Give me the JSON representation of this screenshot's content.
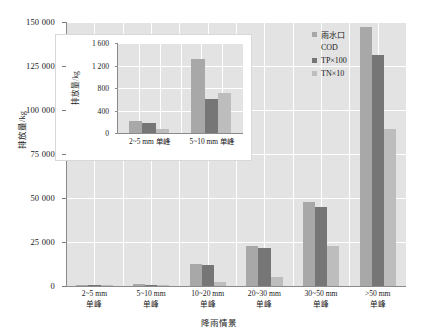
{
  "chart_data": {
    "type": "bar",
    "title": "",
    "xlabel": "降雨情景",
    "ylabel": "排放量/kg",
    "ylim": [
      0,
      150000
    ],
    "yticks": [
      "0",
      "25 000",
      "50 000",
      "75 000",
      "100 000",
      "125 000",
      "150 000"
    ],
    "ytick_values": [
      0,
      25000,
      50000,
      75000,
      100000,
      125000,
      150000
    ],
    "grid": true,
    "legend_position": "top-right",
    "categories": [
      "2~5 mm\n单峰",
      "5~10 mm\n单峰",
      "10~20 mm\n单峰",
      "20~30 mm\n单峰",
      "30~50 mm\n单峰",
      ">50 mm\n单峰"
    ],
    "category_lines": [
      {
        "top": "2~5 mm",
        "bottom": "单峰"
      },
      {
        "top": "5~10 mm",
        "bottom": "单峰"
      },
      {
        "top": "10~20 mm",
        "bottom": "单峰"
      },
      {
        "top": "20~30 mm",
        "bottom": "单峰"
      },
      {
        "top": "30~50 mm",
        "bottom": "单峰"
      },
      {
        "top": ">50 mm",
        "bottom": "单峰"
      }
    ],
    "series": [
      {
        "name": "雨水口 COD",
        "color": "#a8a8a8",
        "values": [
          210,
          1320,
          12500,
          23000,
          48000,
          147000
        ]
      },
      {
        "name": "TP×100",
        "color": "#767676",
        "values": [
          170,
          610,
          12000,
          21500,
          45000,
          131000
        ]
      },
      {
        "name": "TN×10",
        "color": "#bdbdbd",
        "values": [
          70,
          720,
          2500,
          5000,
          23000,
          89000
        ]
      }
    ],
    "legend": [
      {
        "label": "雨水口",
        "label2": "COD",
        "color": "#a8a8a8"
      },
      {
        "label": "TP×100",
        "color": "#767676"
      },
      {
        "label": "TN×10",
        "color": "#bdbdbd"
      }
    ]
  },
  "inset_chart": {
    "type": "bar",
    "xlabel": "",
    "ylabel": "排放量/kg",
    "ylim": [
      0,
      1600
    ],
    "yticks": [
      "0",
      "400",
      "800",
      "1 200",
      "1 600"
    ],
    "ytick_values": [
      0,
      400,
      800,
      1200,
      1600
    ],
    "grid": true,
    "categories": [
      "2~5 mm 单峰",
      "5~10 mm 单峰"
    ],
    "series": [
      {
        "name": "雨水口 COD",
        "color": "#a8a8a8",
        "values": [
          210,
          1320
        ]
      },
      {
        "name": "TP×100",
        "color": "#767676",
        "values": [
          170,
          610
        ]
      },
      {
        "name": "TN×10",
        "color": "#bdbdbd",
        "values": [
          70,
          720
        ]
      }
    ]
  },
  "colors": {
    "plot_background": "#e3e3e3",
    "gridline": "#ffffff",
    "axis": "#8a8a8a",
    "series_1": "#a8a8a8",
    "series_2": "#767676",
    "series_3": "#bdbdbd"
  }
}
